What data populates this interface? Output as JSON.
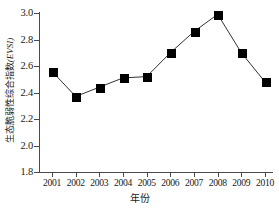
{
  "chart_data": {
    "type": "line",
    "title": "",
    "xlabel": "年份",
    "ylabel": "生态脆弱性综合指数(EVSI)",
    "ylabel_cn": "生态脆弱性综合指数",
    "ylabel_symbol": "(EVSI)",
    "categories": [
      "2001",
      "2002",
      "2003",
      "2004",
      "2005",
      "2006",
      "2007",
      "2008",
      "2009",
      "2010"
    ],
    "values": [
      2.56,
      2.37,
      2.44,
      2.51,
      2.52,
      2.7,
      2.86,
      2.99,
      2.7,
      2.48
    ],
    "series": [
      {
        "name": "生态脆弱性综合指数(EVSI)",
        "values": [
          2.56,
          2.37,
          2.44,
          2.51,
          2.52,
          2.7,
          2.86,
          2.99,
          2.7,
          2.48
        ]
      }
    ],
    "ylim": [
      1.8,
      3.0
    ],
    "yticks": [
      "1.8",
      "2.0",
      "2.2",
      "2.4",
      "2.6",
      "2.8",
      "3.0"
    ],
    "ytick_values": [
      1.8,
      2.0,
      2.2,
      2.4,
      2.6,
      2.8,
      3.0
    ],
    "xticks": [
      "2001",
      "2002",
      "2003",
      "2004",
      "2005",
      "2006",
      "2007",
      "2008",
      "2009",
      "2010"
    ],
    "grid": false,
    "legend": false,
    "marker": "filled-square",
    "line_color": "#333333",
    "marker_color": "#000000"
  }
}
